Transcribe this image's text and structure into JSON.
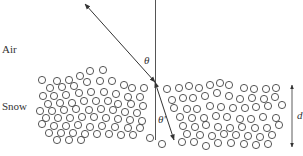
{
  "labels": {
    "air": "Air",
    "snow": "Snow",
    "theta": "θ",
    "theta_prime": "θ′",
    "depth": "d"
  },
  "colors": {
    "line": "#333333",
    "circle": "#444444"
  },
  "geometry": {
    "normal": {
      "x": 155.5,
      "y1": 0,
      "y2": 140
    },
    "incident": {
      "x1": 85,
      "y1": 4,
      "x2": 155,
      "y2": 82
    },
    "refracted": {
      "x1": 155,
      "y1": 82,
      "x2": 174,
      "y2": 140
    },
    "depth_arrow": {
      "x": 292,
      "y1": 85,
      "y2": 147
    },
    "circle_r": 3.6
  },
  "particles": [
    [
      42,
      80
    ],
    [
      57,
      81
    ],
    [
      69,
      80
    ],
    [
      80,
      76
    ],
    [
      90,
      71
    ],
    [
      103,
      70
    ],
    [
      50,
      88
    ],
    [
      62,
      87
    ],
    [
      74,
      86
    ],
    [
      87,
      82
    ],
    [
      100,
      81
    ],
    [
      112,
      81
    ],
    [
      124,
      85
    ],
    [
      132,
      88
    ],
    [
      144,
      88
    ],
    [
      43,
      96
    ],
    [
      54,
      96
    ],
    [
      66,
      95
    ],
    [
      79,
      93
    ],
    [
      91,
      92
    ],
    [
      104,
      92
    ],
    [
      116,
      94
    ],
    [
      128,
      97
    ],
    [
      140,
      97
    ],
    [
      48,
      104
    ],
    [
      60,
      103
    ],
    [
      72,
      103
    ],
    [
      84,
      101
    ],
    [
      96,
      101
    ],
    [
      108,
      101
    ],
    [
      118,
      104
    ],
    [
      131,
      104
    ],
    [
      143,
      106
    ],
    [
      40,
      111
    ],
    [
      52,
      111
    ],
    [
      64,
      110
    ],
    [
      76,
      109
    ],
    [
      89,
      110
    ],
    [
      101,
      109
    ],
    [
      113,
      110
    ],
    [
      125,
      112
    ],
    [
      137,
      113
    ],
    [
      46,
      118
    ],
    [
      58,
      118
    ],
    [
      70,
      118
    ],
    [
      82,
      117
    ],
    [
      94,
      117
    ],
    [
      106,
      118
    ],
    [
      118,
      119
    ],
    [
      130,
      120
    ],
    [
      142,
      121
    ],
    [
      42,
      124
    ],
    [
      54,
      126
    ],
    [
      66,
      126
    ],
    [
      78,
      125
    ],
    [
      90,
      127
    ],
    [
      102,
      126
    ],
    [
      115,
      127
    ],
    [
      128,
      128
    ],
    [
      140,
      128
    ],
    [
      49,
      133
    ],
    [
      61,
      133
    ],
    [
      73,
      133
    ],
    [
      85,
      134
    ],
    [
      97,
      134
    ],
    [
      109,
      134
    ],
    [
      121,
      135
    ],
    [
      133,
      135
    ],
    [
      57,
      140
    ],
    [
      69,
      140
    ],
    [
      81,
      140
    ],
    [
      150,
      138
    ],
    [
      162,
      144
    ],
    [
      167,
      89
    ],
    [
      179,
      88
    ],
    [
      189,
      86
    ],
    [
      199,
      88
    ],
    [
      210,
      85
    ],
    [
      220,
      83
    ],
    [
      229,
      85
    ],
    [
      244,
      88
    ],
    [
      254,
      89
    ],
    [
      266,
      89
    ],
    [
      276,
      88
    ],
    [
      172,
      100
    ],
    [
      183,
      98
    ],
    [
      193,
      98
    ],
    [
      205,
      96
    ],
    [
      217,
      93
    ],
    [
      229,
      96
    ],
    [
      240,
      99
    ],
    [
      252,
      98
    ],
    [
      264,
      99
    ],
    [
      275,
      97
    ],
    [
      174,
      108
    ],
    [
      187,
      109
    ],
    [
      197,
      109
    ],
    [
      210,
      106
    ],
    [
      221,
      107
    ],
    [
      233,
      108
    ],
    [
      245,
      108
    ],
    [
      256,
      107
    ],
    [
      268,
      106
    ],
    [
      282,
      105
    ],
    [
      180,
      117
    ],
    [
      192,
      118
    ],
    [
      204,
      118
    ],
    [
      216,
      116
    ],
    [
      227,
      117
    ],
    [
      240,
      119
    ],
    [
      251,
      119
    ],
    [
      263,
      117
    ],
    [
      276,
      118
    ],
    [
      183,
      126
    ],
    [
      195,
      127
    ],
    [
      206,
      125
    ],
    [
      218,
      127
    ],
    [
      230,
      128
    ],
    [
      242,
      127
    ],
    [
      255,
      128
    ],
    [
      267,
      128
    ],
    [
      279,
      125
    ],
    [
      187,
      134
    ],
    [
      200,
      135
    ],
    [
      212,
      136
    ],
    [
      224,
      134
    ],
    [
      236,
      135
    ],
    [
      248,
      136
    ],
    [
      260,
      137
    ],
    [
      272,
      135
    ],
    [
      182,
      142
    ],
    [
      194,
      142
    ],
    [
      206,
      146
    ],
    [
      218,
      143
    ],
    [
      231,
      143
    ],
    [
      244,
      144
    ],
    [
      256,
      145
    ],
    [
      268,
      144
    ]
  ]
}
